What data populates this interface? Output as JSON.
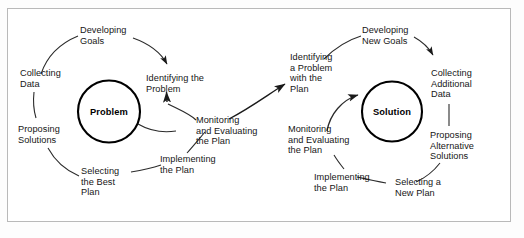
{
  "figure": {
    "frame_color": "#b9b9b9",
    "ink_color": "#161616",
    "background": "#ffffff"
  },
  "cycles": [
    {
      "id": "problem-cycle",
      "hub_label": "Problem",
      "steps": [
        {
          "id": "developing-goals",
          "label": "Developing\nGoals"
        },
        {
          "id": "collecting-data",
          "label": "Collecting\nData"
        },
        {
          "id": "proposing-solutions",
          "label": "Proposing\nSolutions"
        },
        {
          "id": "selecting-the-best-plan",
          "label": "Selecting\nthe Best\nPlan"
        },
        {
          "id": "implementing-the-plan",
          "label": "Implementing\nthe Plan"
        },
        {
          "id": "monitoring-evaluating",
          "label": "Monitoring\nand Evaluating\nthe Plan"
        },
        {
          "id": "identifying-the-problem",
          "label": "Identifying the\nProblem"
        }
      ]
    },
    {
      "id": "solution-cycle",
      "hub_label": "Solution",
      "steps": [
        {
          "id": "developing-new-goals",
          "label": "Developing\nNew Goals"
        },
        {
          "id": "collecting-additional-data",
          "label": "Collecting\nAdditional\nData"
        },
        {
          "id": "proposing-alternative",
          "label": "Proposing\nAlternative\nSolutions"
        },
        {
          "id": "selecting-a-new-plan",
          "label": "Selecting a\nNew Plan"
        },
        {
          "id": "implementing-the-plan-2",
          "label": "Implementing\nthe Plan"
        },
        {
          "id": "monitoring-evaluating-2",
          "label": "Monitoring\nand Evaluating\nthe Plan"
        },
        {
          "id": "identifying-problem-with-plan",
          "label": "Identifying\na Problem\nwith the\nPlan"
        }
      ]
    }
  ]
}
